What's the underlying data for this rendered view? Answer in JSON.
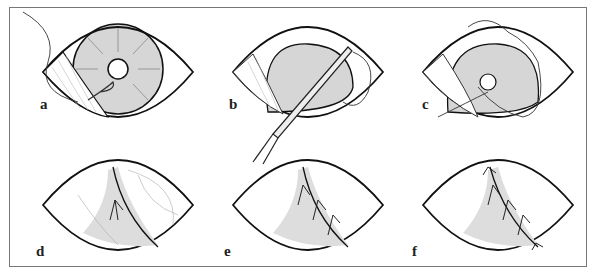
{
  "figure": {
    "panels": [
      {
        "label": "a",
        "step": "suture passed through conjunctiva near limbus"
      },
      {
        "label": "b",
        "step": "needle holder advancing suture"
      },
      {
        "label": "c",
        "step": "suture looped across cornea"
      },
      {
        "label": "d",
        "step": "conjunctival flap with single suture"
      },
      {
        "label": "e",
        "step": "flap secured with three sutures"
      },
      {
        "label": "f",
        "step": "flap secured with sutures at both ends"
      }
    ],
    "colors": {
      "outline": "#111111",
      "cornea_fill": "#d6d6d6",
      "fine_lines": "#999999",
      "frame": "#777777"
    }
  }
}
